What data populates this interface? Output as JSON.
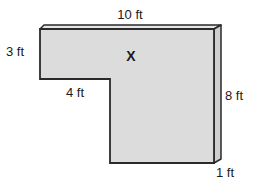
{
  "figure": {
    "shape": "L-shaped slab",
    "fill_color": "#dcdcdc",
    "side_color": "#cfcfcf",
    "top_color": "#e6e6e6",
    "stroke_color": "#2a2a2a",
    "region_marker": "X",
    "labels": {
      "top": "10 ft",
      "left": "3 ft",
      "inner_step": "4 ft",
      "right": "8 ft",
      "depth": "1 ft"
    }
  }
}
